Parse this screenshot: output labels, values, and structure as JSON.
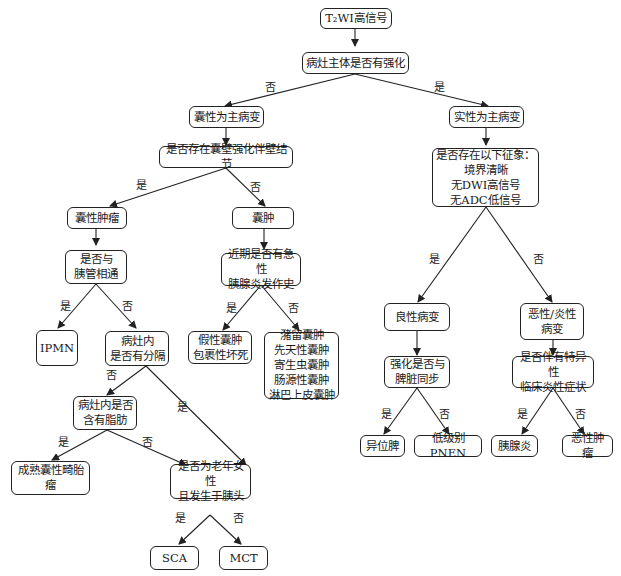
{
  "nodes": {
    "root": "T₂WI高信号",
    "q_enhance": "病灶主体是否有强化",
    "cystic": "囊性为主病变",
    "q_wall": "是否存在囊壁强化伴壁结节",
    "cyst_tumor": "囊性肿瘤",
    "cyst": "囊肿",
    "q_duct": "是否与\n胰管相通",
    "q_pancreatitis": "近期是否有急性\n胰腺炎发作史",
    "ipmn": "IPMN",
    "q_septa": "病灶内\n是否有分隔",
    "pseudocyst": "假性囊肿\n包裹性坏死",
    "other_cysts": "潴留囊肿\n先天性囊肿\n寄生虫囊肿\n肠源性囊肿\n淋巴上皮囊肿",
    "q_fat": "病灶内是否\n含有脂肪",
    "teratoma": "成熟囊性畸胎瘤",
    "q_elderly": "是否为老年女性\n且发生于胰头",
    "sca": "SCA",
    "mct": "MCT",
    "solid": "实性为主病变",
    "q_signs": "是否存在以下征象：\n境界清晰\n无DWI高信号\n无ADC低信号",
    "benign": "良性病变",
    "malignant": "恶性/炎性\n病变",
    "q_spleen": "强化是否与\n脾脏同步",
    "q_clinical": "是否伴有特异性\n临床炎性症状",
    "ectopic_spleen": "异位脾",
    "pnen": "低级别PNEN",
    "pancreatitis": "胰腺炎",
    "malignant_tumor": "恶性肿瘤"
  },
  "edge_labels": {
    "yes": "是",
    "no": "否"
  }
}
